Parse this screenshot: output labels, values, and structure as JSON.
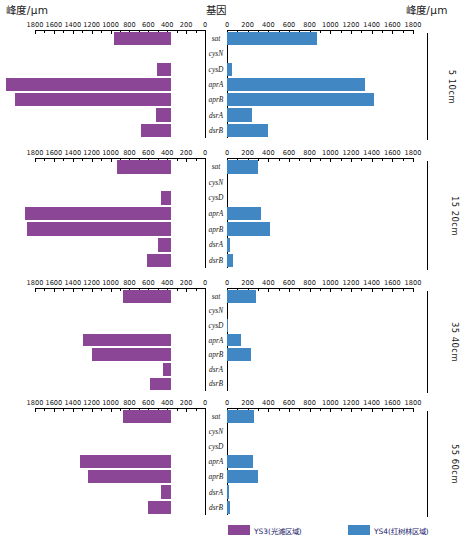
{
  "header": {
    "left_axis_title": "峰度/μm",
    "center_title": "基因",
    "right_axis_title": "峰度/μm"
  },
  "axis": {
    "tick_labels_left": [
      "1800",
      "1600",
      "1400",
      "1200",
      "1000",
      "800",
      "600",
      "400",
      "200",
      "0"
    ],
    "tick_labels_right": [
      "0",
      "200",
      "400",
      "600",
      "800",
      "1000",
      "1200",
      "1400",
      "1600",
      "1800"
    ],
    "max": 1800,
    "minor_step": 100,
    "major_step": 200
  },
  "legend": {
    "items": [
      {
        "label": "YS3(光滩区域)",
        "color": "#8B4795"
      },
      {
        "label": "YS4(红树林区域)",
        "color": "#4187C4"
      }
    ]
  },
  "chart_data": {
    "type": "bar",
    "title": "",
    "orientation": "horizontal-diverging",
    "xlabel": "峰度/μm",
    "ylabel": "基因",
    "xlim": [
      0,
      1800
    ],
    "grid": false,
    "legend_position": "bottom",
    "categories": [
      "sat",
      "cysN",
      "cysD",
      "aprA",
      "aprB",
      "dsrA",
      "dsrB"
    ],
    "panels": [
      {
        "depth_label": "5  10cm",
        "series": [
          {
            "name": "YS3(光滩区域)",
            "side": "left",
            "color": "#8B4795",
            "values": [
              600,
              0,
              150,
              1750,
              1650,
              160,
              320
            ]
          },
          {
            "name": "YS4(红树林区域)",
            "side": "right",
            "color": "#4187C4",
            "values": [
              870,
              0,
              50,
              1340,
              1420,
              240,
              400
            ]
          }
        ]
      },
      {
        "depth_label": "15  20cm",
        "series": [
          {
            "name": "YS3(光滩区域)",
            "side": "left",
            "color": "#8B4795",
            "values": [
              570,
              0,
              110,
              1550,
              1520,
              140,
              250
            ]
          },
          {
            "name": "YS4(红树林区域)",
            "side": "right",
            "color": "#4187C4",
            "values": [
              300,
              0,
              0,
              330,
              420,
              30,
              60
            ]
          }
        ]
      },
      {
        "depth_label": "35  40cm",
        "series": [
          {
            "name": "YS3(光滩区域)",
            "side": "left",
            "color": "#8B4795",
            "values": [
              510,
              0,
              0,
              930,
              840,
              80,
              220
            ]
          },
          {
            "name": "YS4(红树林区域)",
            "side": "right",
            "color": "#4187C4",
            "values": [
              280,
              0,
              10,
              140,
              230,
              0,
              0
            ]
          }
        ]
      },
      {
        "depth_label": "55  60cm",
        "series": [
          {
            "name": "YS3(光滩区域)",
            "side": "left",
            "color": "#8B4795",
            "values": [
              510,
              0,
              0,
              960,
              880,
              110,
              240
            ]
          },
          {
            "name": "YS4(红树林区域)",
            "side": "right",
            "color": "#4187C4",
            "values": [
              260,
              0,
              0,
              250,
              300,
              20,
              30
            ]
          }
        ]
      }
    ]
  }
}
